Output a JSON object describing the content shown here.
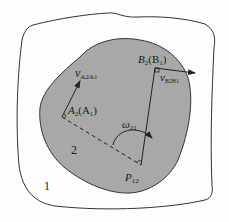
{
  "diagram": {
    "type": "kinematics instant center diagram",
    "colors": {
      "body2_fill": "#a8a8a8",
      "stroke": "#222222",
      "background": "#ffffff"
    },
    "labels": {
      "body1": "1",
      "body2": "2",
      "point_A_main": "A",
      "point_A_sub": "2",
      "point_A_paren": "(A",
      "point_A_paren_sub": "1",
      "point_A_close": ")",
      "point_B_main": "B",
      "point_B_sub": "2",
      "point_B_paren": "(B",
      "point_B_paren_sub": "1",
      "point_B_close": ")",
      "velocity_A_main": "v",
      "velocity_A_sub": "A2A1",
      "velocity_B_main": "v",
      "velocity_B_sub": "B2B1",
      "omega_main": "ω",
      "omega_sub": "21",
      "pole_main": "P",
      "pole_sub": "12"
    }
  }
}
